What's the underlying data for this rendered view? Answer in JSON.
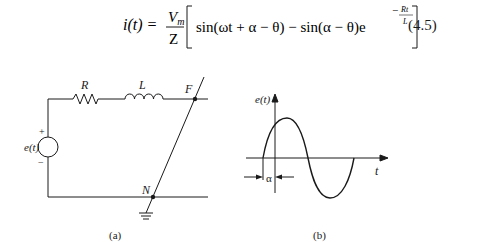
{
  "equation": {
    "lhs": "i(t) =",
    "frac_num_base": "V",
    "frac_num_sub": "m",
    "frac_den": "Z",
    "term1": "sin(ωt + α − θ) − sin(α − θ)e",
    "exp_num": "Rt",
    "exp_den": "L",
    "exp_sign": "−",
    "number": "(4.5)"
  },
  "circuit": {
    "resistor_label": "R",
    "inductor_label": "L",
    "fault_node_label": "F",
    "neutral_node_label": "N",
    "source_label": "e(t)",
    "plus_sign": "+",
    "minus_sign": "−",
    "caption": "(a)"
  },
  "waveform": {
    "y_label": "e(t)",
    "x_label": "t",
    "offset_label": "α",
    "caption": "(b)"
  }
}
